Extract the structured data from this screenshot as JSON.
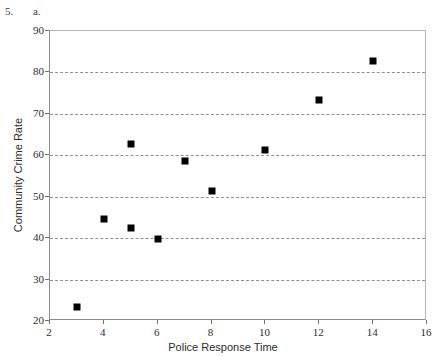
{
  "problem": {
    "number": "5.",
    "part": "a."
  },
  "chart_data": {
    "type": "scatter",
    "title": "",
    "xlabel": "Police Response Time",
    "ylabel": "Community Crime Rate",
    "xlim": [
      2,
      16
    ],
    "ylim": [
      20,
      90
    ],
    "xticks": [
      2,
      4,
      6,
      8,
      10,
      12,
      14,
      16
    ],
    "yticks": [
      20,
      30,
      40,
      50,
      60,
      70,
      80,
      90
    ],
    "grid": "horizontal-dashed",
    "legend": null,
    "marker": "filled-square",
    "marker_color": "#000000",
    "points": [
      {
        "x": 3,
        "y": 23.4
      },
      {
        "x": 4,
        "y": 44.6
      },
      {
        "x": 5,
        "y": 42.4
      },
      {
        "x": 5,
        "y": 62.8
      },
      {
        "x": 6,
        "y": 39.9
      },
      {
        "x": 7,
        "y": 58.6
      },
      {
        "x": 8,
        "y": 51.3
      },
      {
        "x": 10,
        "y": 61.3
      },
      {
        "x": 12,
        "y": 73.3
      },
      {
        "x": 14,
        "y": 82.7
      }
    ]
  }
}
